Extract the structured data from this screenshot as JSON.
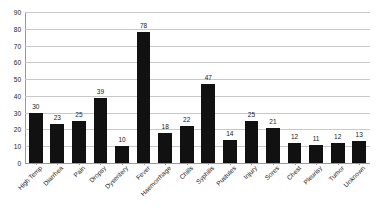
{
  "chart_data": {
    "type": "bar",
    "title": "",
    "subtitle": "",
    "xlabel": "",
    "ylabel": "",
    "ylim": [
      0,
      90
    ],
    "y_ticks": [
      0,
      10,
      20,
      30,
      40,
      50,
      60,
      70,
      80,
      90
    ],
    "grid": true,
    "legend": false,
    "legend_position": "none",
    "bar_color": "#111111",
    "grid_color": "#c9c9c9",
    "axis_color": "#9a9a9a",
    "label_rotation": -45,
    "categories": [
      "High Temp",
      "Diarrhea",
      "Pain",
      "Dropsy",
      "Dysentery",
      "Fever",
      "Haemorrhage",
      "Chills",
      "Syphilis",
      "Pustules",
      "Injury",
      "Sores",
      "Chest",
      "Pleurisy",
      "Tumor",
      "Unknown"
    ],
    "values": [
      30,
      23,
      25,
      39,
      10,
      78,
      18,
      22,
      47,
      14,
      25,
      21,
      12,
      11,
      12,
      13
    ]
  }
}
